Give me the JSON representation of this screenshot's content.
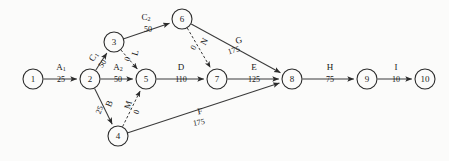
{
  "diagram": {
    "type": "activity-on-arrow-network",
    "background_color": "#fbfbfa",
    "ink_color": "#2b2b2b",
    "nodes": [
      {
        "id": "1",
        "label": "1",
        "x": 33,
        "y": 79,
        "r": 10
      },
      {
        "id": "2",
        "label": "2",
        "x": 90,
        "y": 79,
        "r": 10
      },
      {
        "id": "3",
        "label": "3",
        "x": 114,
        "y": 42,
        "r": 10
      },
      {
        "id": "4",
        "label": "4",
        "x": 118,
        "y": 136,
        "r": 10
      },
      {
        "id": "5",
        "label": "5",
        "x": 146,
        "y": 79,
        "r": 10
      },
      {
        "id": "6",
        "label": "6",
        "x": 182,
        "y": 19,
        "r": 10
      },
      {
        "id": "7",
        "label": "7",
        "x": 217,
        "y": 79,
        "r": 10
      },
      {
        "id": "8",
        "label": "8",
        "x": 292,
        "y": 79,
        "r": 10
      },
      {
        "id": "9",
        "label": "9",
        "x": 367,
        "y": 79,
        "r": 10
      },
      {
        "id": "10",
        "label": "10",
        "x": 425,
        "y": 79,
        "r": 10
      }
    ],
    "edges": [
      {
        "id": "A1",
        "from": "1",
        "to": "2",
        "name": "A",
        "sub": "1",
        "duration": "25",
        "style": "solid",
        "name_x": 61,
        "name_y": 68,
        "dur_x": 61,
        "dur_y": 80,
        "rotate": 0
      },
      {
        "id": "A2",
        "from": "2",
        "to": "5",
        "name": "A",
        "sub": "2",
        "duration": "50",
        "style": "solid",
        "name_x": 118,
        "name_y": 68,
        "dur_x": 118,
        "dur_y": 80,
        "rotate": 0
      },
      {
        "id": "C1",
        "from": "2",
        "to": "3",
        "name": "C",
        "sub": "1",
        "duration": "50",
        "style": "solid",
        "name_x": 94,
        "name_y": 57,
        "dur_x": 103,
        "dur_y": 64,
        "rotate": -57
      },
      {
        "id": "C2",
        "from": "3",
        "to": "6",
        "name": "C",
        "sub": "2",
        "duration": "50",
        "style": "solid",
        "name_x": 146,
        "name_y": 18,
        "dur_x": 148,
        "dur_y": 30,
        "rotate": 0
      },
      {
        "id": "L",
        "from": "3",
        "to": "5",
        "name": "L",
        "sub": "",
        "duration": "0",
        "style": "dashed",
        "name_x": 136,
        "name_y": 53,
        "dur_x": 128,
        "dur_y": 59,
        "rotate": -75
      },
      {
        "id": "B",
        "from": "2",
        "to": "4",
        "name": "B",
        "sub": "",
        "duration": "25",
        "style": "solid",
        "name_x": 110,
        "name_y": 104,
        "dur_x": 100,
        "dur_y": 110,
        "rotate": -68
      },
      {
        "id": "M",
        "from": "4",
        "to": "5",
        "name": "M",
        "sub": "",
        "duration": "0",
        "style": "dashed",
        "name_x": 129,
        "name_y": 105,
        "dur_x": 137,
        "dur_y": 112,
        "rotate": -73
      },
      {
        "id": "D",
        "from": "5",
        "to": "7",
        "name": "D",
        "sub": "",
        "duration": "110",
        "style": "solid",
        "name_x": 181,
        "name_y": 68,
        "dur_x": 181,
        "dur_y": 80,
        "rotate": 0
      },
      {
        "id": "N",
        "from": "6",
        "to": "7",
        "name": "N",
        "sub": "",
        "duration": "0",
        "style": "dashed",
        "name_x": 205,
        "name_y": 42,
        "dur_x": 194,
        "dur_y": 48,
        "rotate": -62
      },
      {
        "id": "G",
        "from": "6",
        "to": "8",
        "name": "G",
        "sub": "",
        "duration": "175",
        "style": "solid",
        "name_x": 239,
        "name_y": 41,
        "dur_x": 234,
        "dur_y": 51,
        "rotate": -17
      },
      {
        "id": "E",
        "from": "7",
        "to": "8",
        "name": "E",
        "sub": "",
        "duration": "125",
        "style": "solid",
        "name_x": 254,
        "name_y": 68,
        "dur_x": 254,
        "dur_y": 80,
        "rotate": 0
      },
      {
        "id": "F",
        "from": "4",
        "to": "8",
        "name": "F",
        "sub": "",
        "duration": "175",
        "style": "solid",
        "name_x": 200,
        "name_y": 112,
        "dur_x": 199,
        "dur_y": 123,
        "rotate": -10
      },
      {
        "id": "H",
        "from": "8",
        "to": "9",
        "name": "H",
        "sub": "",
        "duration": "75",
        "style": "solid",
        "name_x": 330,
        "name_y": 68,
        "dur_x": 330,
        "dur_y": 80,
        "rotate": 0
      },
      {
        "id": "I",
        "from": "9",
        "to": "10",
        "name": "I",
        "sub": "",
        "duration": "10",
        "style": "solid",
        "name_x": 396,
        "name_y": 68,
        "dur_x": 396,
        "dur_y": 80,
        "rotate": 0
      }
    ]
  }
}
